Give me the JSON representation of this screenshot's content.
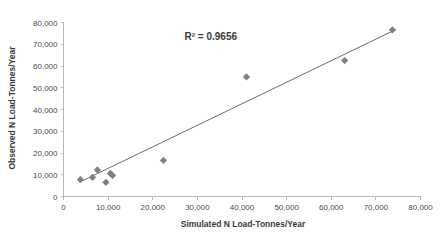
{
  "chart_data": {
    "type": "scatter",
    "title": "",
    "xlabel": "Simulated N Load-Tonnes/Year",
    "ylabel": "Observed N Load-Tonnes/Year",
    "xlim": [
      0,
      80000
    ],
    "ylim": [
      0,
      80000
    ],
    "grid": false,
    "legend": null,
    "xticks": [
      0,
      10000,
      20000,
      30000,
      40000,
      50000,
      60000,
      70000,
      80000
    ],
    "yticks": [
      0,
      10000,
      20000,
      30000,
      40000,
      50000,
      60000,
      70000,
      80000
    ],
    "xtick_labels": [
      "0",
      "10,000",
      "20,000",
      "30,000",
      "40,000",
      "50,000",
      "60,000",
      "70,000",
      "80,000"
    ],
    "ytick_labels": [
      "0",
      "10,000",
      "20,000",
      "30,000",
      "40,000",
      "50,000",
      "60,000",
      "70,000",
      "80,000"
    ],
    "annotations": [
      {
        "name": "r-squared",
        "text": "R² = 0.9656",
        "x": 33000,
        "y": 72000
      }
    ],
    "series": [
      {
        "name": "Observed vs Simulated N Load",
        "marker": "diamond",
        "color": "#808080",
        "points": [
          {
            "x": 3800,
            "y": 7800
          },
          {
            "x": 6500,
            "y": 8800
          },
          {
            "x": 7600,
            "y": 12200
          },
          {
            "x": 9500,
            "y": 6500
          },
          {
            "x": 10500,
            "y": 10600
          },
          {
            "x": 11000,
            "y": 9700
          },
          {
            "x": 22400,
            "y": 16600
          },
          {
            "x": 41000,
            "y": 55000
          },
          {
            "x": 63000,
            "y": 62500
          },
          {
            "x": 73700,
            "y": 76600
          }
        ]
      }
    ],
    "trendline": {
      "name": "linear-fit",
      "color": "#6e6e6e",
      "x_start": 3500,
      "y_start": 6500,
      "x_end": 74500,
      "y_end": 76800
    }
  }
}
